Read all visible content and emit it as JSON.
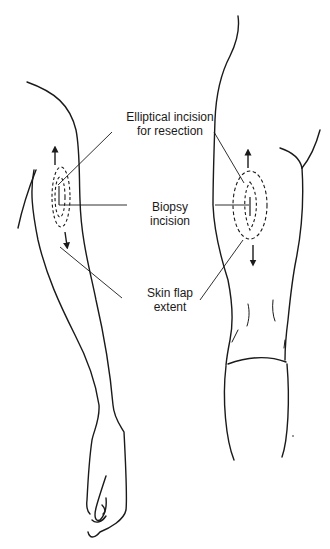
{
  "diagram": {
    "labels": {
      "elliptical_incision": [
        "Elliptical incision",
        "for resection"
      ],
      "biopsy_incision": [
        "Biopsy",
        "incision"
      ],
      "skin_flap": [
        "Skin flap",
        "extent"
      ]
    },
    "figures": [
      {
        "name": "left-arm-view",
        "description": "Full arm with hand, lateral view"
      },
      {
        "name": "right-upper-arm-view",
        "description": "Upper arm and shoulder, posterior view"
      }
    ],
    "markers": {
      "arrow_direction_up": "flap extent proximal",
      "arrow_direction_down": "flap extent distal"
    },
    "colors": {
      "line": "#1a1a1a",
      "background": "#ffffff"
    }
  }
}
